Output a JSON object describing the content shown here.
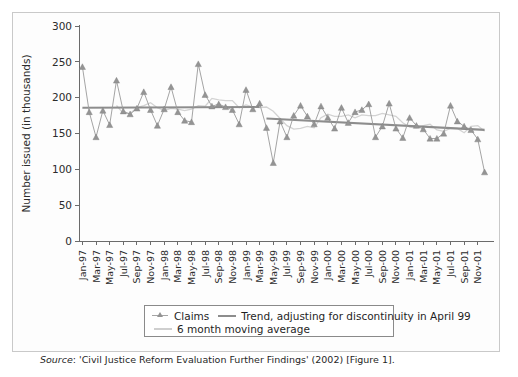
{
  "figure": {
    "source_prefix": "Source",
    "source_text": ": 'Civil Justice Reform Evaluation Further Findings' (2002) [Figure 1]."
  },
  "legend": {
    "claims_label": "Claims",
    "trend_label": "Trend, adjusting for discontinuity in April 99",
    "moving_average_label": "6 month moving average"
  },
  "chart_data": {
    "type": "line",
    "title": "",
    "xlabel": "",
    "ylabel": "Number issued (in thousands)",
    "ylim": [
      0,
      300
    ],
    "yticks": [
      0,
      50,
      100,
      150,
      200,
      250,
      300
    ],
    "grid": false,
    "legend_position": "bottom",
    "x_tick_labels": [
      "Jan-97",
      "Mar-97",
      "May-97",
      "Jul-97",
      "Sep-97",
      "Nov-97",
      "Jan-98",
      "Mar-98",
      "May-98",
      "Jul-98",
      "Sep-98",
      "Nov-98",
      "Jan-99",
      "Mar-99",
      "May-99",
      "Jul-99",
      "Sep-99",
      "Nov-99",
      "Jan-00",
      "Mar-00",
      "May-00",
      "Jul-00",
      "Sep-00",
      "Nov-00",
      "Jan-01",
      "Mar-01",
      "May-01",
      "Jul-01",
      "Sep-01",
      "Nov-01"
    ],
    "x": [
      "Jan-97",
      "Feb-97",
      "Mar-97",
      "Apr-97",
      "May-97",
      "Jun-97",
      "Jul-97",
      "Aug-97",
      "Sep-97",
      "Oct-97",
      "Nov-97",
      "Dec-97",
      "Jan-98",
      "Feb-98",
      "Mar-98",
      "Apr-98",
      "May-98",
      "Jun-98",
      "Jul-98",
      "Aug-98",
      "Sep-98",
      "Oct-98",
      "Nov-98",
      "Dec-98",
      "Jan-99",
      "Feb-99",
      "Mar-99",
      "Apr-99",
      "May-99",
      "Jun-99",
      "Jul-99",
      "Aug-99",
      "Sep-99",
      "Oct-99",
      "Nov-99",
      "Dec-99",
      "Jan-00",
      "Feb-00",
      "Mar-00",
      "Apr-00",
      "May-00",
      "Jun-00",
      "Jul-00",
      "Aug-00",
      "Sep-00",
      "Oct-00",
      "Nov-00",
      "Dec-00",
      "Jan-01",
      "Feb-01",
      "Mar-01",
      "Apr-01",
      "May-01",
      "Jun-01",
      "Jul-01",
      "Aug-01",
      "Sep-01",
      "Oct-01",
      "Nov-01",
      "Dec-01"
    ],
    "series": [
      {
        "name": "Claims",
        "type": "line-marker",
        "marker": "triangle",
        "color": "#949494",
        "values": [
          243,
          180,
          145,
          182,
          162,
          224,
          181,
          177,
          185,
          208,
          183,
          161,
          184,
          215,
          180,
          168,
          166,
          247,
          204,
          188,
          191,
          187,
          183,
          163,
          211,
          184,
          192,
          158,
          109,
          167,
          145,
          175,
          189,
          174,
          163,
          188,
          172,
          157,
          186,
          165,
          180,
          183,
          191,
          145,
          160,
          192,
          157,
          144,
          172,
          161,
          156,
          143,
          143,
          150,
          189,
          167,
          160,
          155,
          142,
          96
        ]
      },
      {
        "name": "Trend, adjusting for discontinuity in April 99",
        "type": "line",
        "color": "#8d8d8d",
        "segments": [
          {
            "from": "Jan-97",
            "to": "Mar-99",
            "start_value": 186,
            "end_value": 187
          },
          {
            "from": "Apr-99",
            "to": "Dec-01",
            "start_value": 171,
            "end_value": 155
          }
        ]
      },
      {
        "name": "6 month moving average",
        "type": "line",
        "color": "#d3d3d3",
        "values": [
          null,
          null,
          null,
          null,
          null,
          189,
          178,
          178,
          186,
          189,
          193,
          186,
          182,
          185,
          184,
          182,
          184,
          189,
          188,
          199,
          197,
          196,
          196,
          186,
          190,
          187,
          186,
          187,
          181,
          171,
          161,
          156,
          157,
          160,
          158,
          172,
          177,
          174,
          174,
          176,
          172,
          176,
          175,
          175,
          178,
          176,
          174,
          165,
          159,
          158,
          161,
          163,
          155,
          153,
          157,
          157,
          151,
          160,
          161,
          153
        ]
      }
    ]
  }
}
